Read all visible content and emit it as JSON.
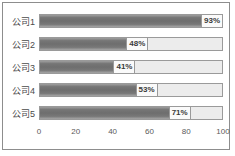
{
  "chart_data": {
    "type": "bar",
    "orientation": "horizontal",
    "title": "",
    "xlabel": "",
    "ylabel": "",
    "categories": [
      "公司1",
      "公司2",
      "公司3",
      "公司4",
      "公司5"
    ],
    "values": [
      93,
      48,
      41,
      53,
      71
    ],
    "value_labels": [
      "93%",
      "48%",
      "41%",
      "53%",
      "71%"
    ],
    "xlim": [
      0,
      100
    ],
    "xticks": [
      0,
      20,
      40,
      60,
      80,
      100
    ],
    "xtick_labels": [
      "0",
      "20",
      "40",
      "60",
      "80",
      "100"
    ],
    "grid": false,
    "legend": null,
    "colors": {
      "bar_fill_dark": "#6e6e6e",
      "bar_fill_light": "#a6a6a6",
      "bar_track": "#ececec",
      "bar_border": "#9a9a9a",
      "label_text": "#4b4b4b",
      "tick_text": "#5a5a5a",
      "frame_border": "#8d8d8d",
      "background": "#ffffff"
    }
  }
}
